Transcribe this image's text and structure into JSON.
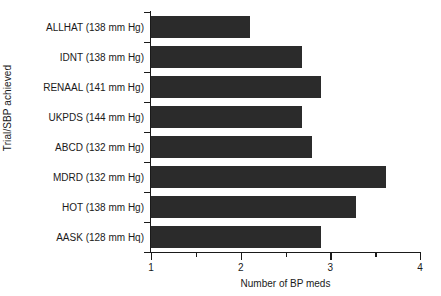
{
  "chart_data": {
    "type": "bar",
    "orientation": "horizontal",
    "title": "",
    "xlabel": "Number of BP meds",
    "ylabel": "Trial/SBP achieved",
    "xlim": [
      1,
      4
    ],
    "grid": false,
    "legend": null,
    "bar_color": "#2b2b2b",
    "axis_color": "#1a1a1a",
    "background": "#ffffff",
    "xticks": [
      1,
      2,
      3,
      4
    ],
    "xticklabels": [
      "1",
      "2",
      "3",
      "4"
    ],
    "xminorticks": [
      1.5,
      2.5,
      3.5
    ],
    "categories": [
      "ALLHAT (138 mm Hg)",
      "IDNT (138 mm Hg)",
      "RENAAL (141 mm Hg)",
      "UKPDS (144 mm Hg)",
      "ABCD (132 mm Hg)",
      "MDRD (132 mm Hg)",
      "HOT (138 mm Hg)",
      "AASK (128 mm Hq)"
    ],
    "values": [
      2.1,
      2.68,
      2.9,
      2.68,
      2.8,
      3.62,
      3.29,
      2.9
    ],
    "bars": [
      {
        "label": "ALLHAT (138 mm Hg)",
        "trial": "ALLHAT",
        "sbp": "138 mm Hg",
        "value": 2.1
      },
      {
        "label": "IDNT (138 mm Hg)",
        "trial": "IDNT",
        "sbp": "138 mm Hg",
        "value": 2.68
      },
      {
        "label": "RENAAL (141 mm Hg)",
        "trial": "RENAAL",
        "sbp": "141 mm Hg",
        "value": 2.9
      },
      {
        "label": "UKPDS (144 mm Hg)",
        "trial": "UKPDS",
        "sbp": "144 mm Hg",
        "value": 2.68
      },
      {
        "label": "ABCD (132 mm Hg)",
        "trial": "ABCD",
        "sbp": "132 mm Hg",
        "value": 2.8
      },
      {
        "label": "MDRD (132 mm Hg)",
        "trial": "MDRD",
        "sbp": "132 mm Hg",
        "value": 3.62
      },
      {
        "label": "HOT (138 mm Hg)",
        "trial": "HOT",
        "sbp": "138 mm Hg",
        "value": 3.29
      },
      {
        "label": "AASK (128 mm Hq)",
        "trial": "AASK",
        "sbp": "128 mm Hq",
        "value": 2.9
      }
    ]
  }
}
